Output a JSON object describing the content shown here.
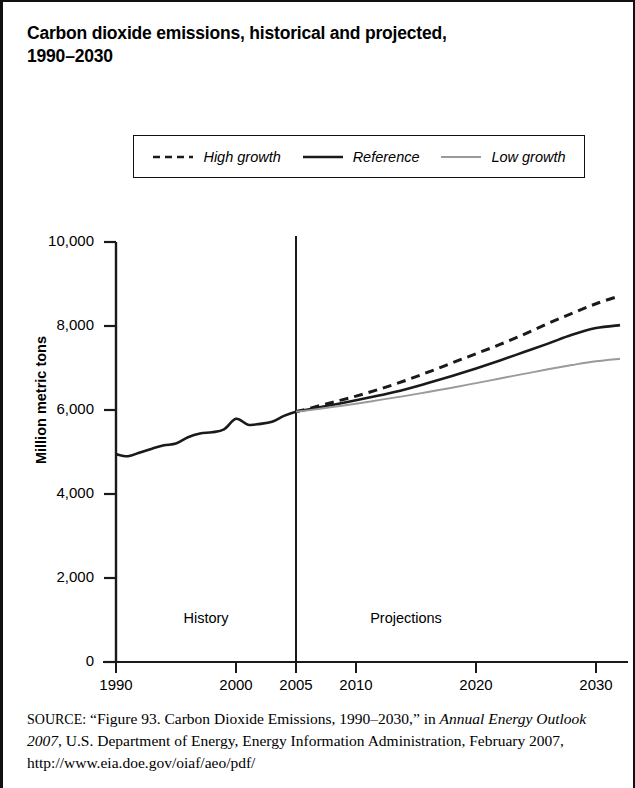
{
  "figure": {
    "title": "Carbon dioxide emissions, historical and projected, 1990–2030",
    "title_line1": "Carbon dioxide emissions, historical and projected,",
    "title_line2": "1990–2030"
  },
  "legend": {
    "items": [
      {
        "label": "High growth",
        "style": "dashed",
        "color": "#1a1a1a"
      },
      {
        "label": "Reference",
        "style": "solid",
        "color": "#1a1a1a"
      },
      {
        "label": "Low growth",
        "style": "solid",
        "color": "#9a9a9a"
      }
    ]
  },
  "annotations": {
    "history": "History",
    "projections": "Projections",
    "divider_year": 2005
  },
  "source": {
    "label": "SOURCE:",
    "text_1": "“Figure 93. Carbon Dioxide Emissions, 1990–2030,” in ",
    "italic_1": "Annual Energy Outlook 2007",
    "text_2": ", U.S. Department of Energy, Energy Information Administration, February 2007, http://www.eia.doe.gov/oiaf/aeo/pdf/"
  },
  "chart_data": {
    "type": "line",
    "title": "Carbon dioxide emissions, historical and projected, 1990–2030",
    "xlabel": "",
    "ylabel": "Million metric tons",
    "xlim": [
      1990,
      2032
    ],
    "ylim": [
      0,
      10000
    ],
    "yticks": [
      0,
      2000,
      4000,
      6000,
      8000,
      10000
    ],
    "ytick_labels": [
      "0",
      "2,000",
      "4,000",
      "6,000",
      "8,000",
      "10,000"
    ],
    "xticks": [
      1990,
      2000,
      2005,
      2010,
      2020,
      2030
    ],
    "xtick_labels": [
      "1990",
      "2000",
      "2005",
      "2010",
      "2020",
      "2030"
    ],
    "grid": false,
    "legend_position": "above-plot",
    "units": "Million metric tons of carbon dioxide",
    "divider_year": 2005,
    "series": [
      {
        "name": "High growth",
        "style": "dashed",
        "color": "#1a1a1a",
        "x": [
          2005,
          2006,
          2008,
          2010,
          2012,
          2014,
          2016,
          2018,
          2020,
          2022,
          2024,
          2026,
          2028,
          2030,
          2032
        ],
        "values": [
          5960,
          6030,
          6180,
          6330,
          6500,
          6690,
          6900,
          7120,
          7340,
          7560,
          7800,
          8060,
          8300,
          8530,
          8720
        ]
      },
      {
        "name": "Reference",
        "style": "solid",
        "color": "#1a1a1a",
        "x": [
          1990,
          1991,
          1992,
          1993,
          1994,
          1995,
          1996,
          1997,
          1998,
          1999,
          2000,
          2001,
          2002,
          2003,
          2004,
          2005,
          2006,
          2008,
          2010,
          2012,
          2014,
          2016,
          2018,
          2020,
          2022,
          2024,
          2026,
          2028,
          2030,
          2032
        ],
        "values": [
          4950,
          4900,
          4990,
          5080,
          5160,
          5200,
          5350,
          5440,
          5470,
          5540,
          5790,
          5650,
          5670,
          5720,
          5860,
          5960,
          6010,
          6120,
          6230,
          6350,
          6480,
          6640,
          6810,
          6990,
          7180,
          7380,
          7580,
          7790,
          7950,
          8020
        ]
      },
      {
        "name": "Low growth",
        "style": "solid",
        "color": "#9a9a9a",
        "x": [
          2005,
          2006,
          2008,
          2010,
          2012,
          2014,
          2016,
          2018,
          2020,
          2022,
          2024,
          2026,
          2028,
          2030,
          2032
        ],
        "values": [
          5960,
          5990,
          6070,
          6150,
          6240,
          6330,
          6430,
          6530,
          6640,
          6750,
          6860,
          6970,
          7070,
          7160,
          7220
        ]
      }
    ]
  }
}
